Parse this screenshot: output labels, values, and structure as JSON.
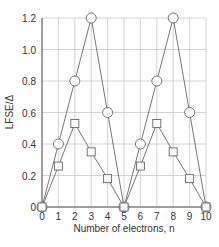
{
  "chart_data": {
    "type": "line",
    "title": "",
    "xlabel": "Number of electrons, n",
    "ylabel": "LFSE/Δ",
    "x": [
      0,
      1,
      2,
      3,
      4,
      5,
      6,
      7,
      8,
      9,
      10
    ],
    "xticks": [
      "0",
      "1",
      "2",
      "3",
      "4",
      "5",
      "6",
      "7",
      "8",
      "9",
      "10"
    ],
    "yticks": [
      "0",
      "0.2",
      "0.4",
      "0.6",
      "0.8",
      "1.0",
      "1.2"
    ],
    "xlim": [
      0,
      10
    ],
    "ylim": [
      0,
      1.2
    ],
    "grid": true,
    "legend": null,
    "series": [
      {
        "name": "circles",
        "marker": "circle",
        "values": [
          0,
          0.4,
          0.8,
          1.2,
          0.6,
          0,
          0.4,
          0.8,
          1.2,
          0.6,
          0
        ]
      },
      {
        "name": "squares",
        "marker": "square",
        "values": [
          0,
          0.26,
          0.53,
          0.35,
          0.18,
          0,
          0.26,
          0.53,
          0.35,
          0.18,
          0
        ]
      }
    ],
    "colors": {
      "line": "#666666",
      "grid": "#c8c8c8",
      "axis": "#555555",
      "marker_fill": "#ffffff"
    }
  }
}
